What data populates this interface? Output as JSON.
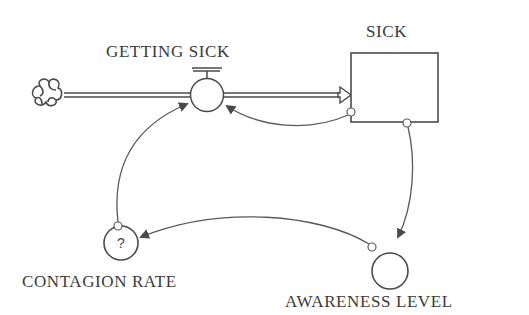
{
  "diagram": {
    "type": "stock-and-flow",
    "colors": {
      "stroke": "#4a4a4a",
      "text": "#3a3a3a",
      "background": "#ffffff"
    },
    "source": {
      "icon": "cloud-icon",
      "label": ""
    },
    "flow": {
      "label": "GETTING SICK"
    },
    "stock": {
      "label": "SICK"
    },
    "auxiliaries": [
      {
        "label": "CONTAGION RATE",
        "symbol": "?"
      },
      {
        "label": "AWARENESS LEVEL",
        "symbol": ""
      }
    ],
    "links": [
      {
        "from": "SICK",
        "to": "GETTING SICK"
      },
      {
        "from": "CONTAGION RATE",
        "to": "GETTING SICK"
      },
      {
        "from": "SICK",
        "to": "AWARENESS LEVEL"
      },
      {
        "from": "AWARENESS LEVEL",
        "to": "CONTAGION RATE"
      }
    ]
  }
}
